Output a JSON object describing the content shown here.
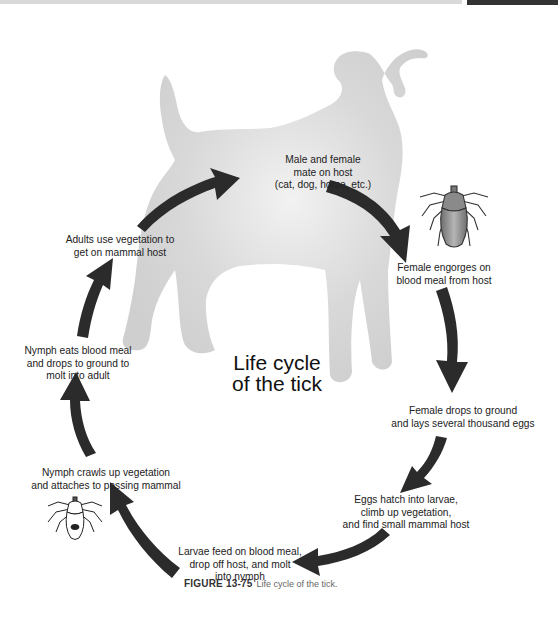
{
  "diagram": {
    "title_line1": "Life cycle",
    "title_line2": "of the tick",
    "background_silhouette": "dog-silhouette",
    "steps": [
      {
        "id": "mate",
        "lines": [
          "Male and female",
          "mate on host",
          "(cat, dog, horse, etc.)"
        ]
      },
      {
        "id": "engorge",
        "lines": [
          "Female engorges on",
          "blood meal from host"
        ]
      },
      {
        "id": "lay-eggs",
        "lines": [
          "Female drops to ground",
          "and lays several thousand eggs"
        ]
      },
      {
        "id": "hatch",
        "lines": [
          "Eggs hatch into larvae,",
          "climb up vegetation,",
          "and find small mammal host"
        ]
      },
      {
        "id": "larvae-feed",
        "lines": [
          "Larvae feed on blood meal,",
          "drop off host, and molt",
          "into nymph"
        ]
      },
      {
        "id": "nymph-crawl",
        "lines": [
          "Nymph crawls up vegetation",
          "and attaches to passing mammal"
        ]
      },
      {
        "id": "nymph-eat",
        "lines": [
          "Nymph eats blood meal",
          "and drops to ground to",
          "molt into adult"
        ]
      },
      {
        "id": "adult-climb",
        "lines": [
          "Adults use vegetation to",
          "get on mammal host"
        ]
      }
    ],
    "illustrations": [
      "engorged-female-tick",
      "nymph-tick"
    ]
  },
  "caption": {
    "figure_label": "FIGURE 13-75",
    "text": "Life cycle of the tick."
  },
  "colors": {
    "arrow": "#2b2b2b",
    "dog_silhouette": "#d6d6d6",
    "text": "#222222"
  }
}
